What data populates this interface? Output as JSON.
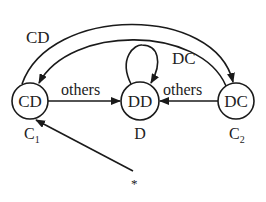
{
  "diagram": {
    "type": "state-transition",
    "nodes": [
      {
        "id": "C1",
        "label": "CD",
        "caption": "C",
        "caption_sub": "1"
      },
      {
        "id": "D",
        "label": "DD",
        "caption": "D",
        "caption_sub": ""
      },
      {
        "id": "C2",
        "label": "DC",
        "caption": "C",
        "caption_sub": "2"
      }
    ],
    "edges": [
      {
        "from": "C1",
        "to": "C2",
        "label": "CD",
        "style": "outer-arc"
      },
      {
        "from": "C2",
        "to": "C1",
        "label": "DC",
        "style": "inner-arc"
      },
      {
        "from": "D",
        "to": "D",
        "label": "",
        "style": "self-loop"
      },
      {
        "from": "C1",
        "to": "D",
        "label": "others"
      },
      {
        "from": "C2",
        "to": "D",
        "label": "others"
      },
      {
        "from": "start",
        "to": "C1",
        "label": ""
      }
    ],
    "start_marker": "*"
  }
}
